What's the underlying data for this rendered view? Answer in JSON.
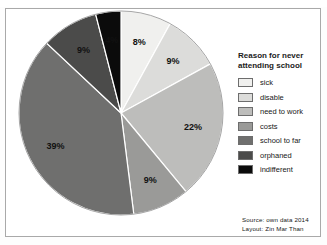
{
  "figure": {
    "top_cropped_text": "",
    "background_color": "#ffffff",
    "border_color": "#a9a9a9"
  },
  "legend": {
    "title_line1": "Reason for never",
    "title_line2": "attending school",
    "items": [
      {
        "label": "sick",
        "color": "#f0f0ee"
      },
      {
        "label": "disable",
        "color": "#dcdcda"
      },
      {
        "label": "need to work",
        "color": "#bdbdbb"
      },
      {
        "label": "costs",
        "color": "#9a9a98"
      },
      {
        "label": "school to far",
        "color": "#6f6f6e"
      },
      {
        "label": "orphaned",
        "color": "#4b4b4a"
      },
      {
        "label": "indifferent",
        "color": "#0b0b0b"
      }
    ]
  },
  "source": {
    "line1": "Source: own data 2014",
    "line2": "Layout: Zin Mar Than"
  },
  "chart_data": {
    "type": "pie",
    "title": "Reason for never attending school",
    "xlabel": "",
    "ylabel": "",
    "units": "percent",
    "start_angle_deg": 0,
    "direction": "clockwise",
    "categories": [
      "sick",
      "disable",
      "need to work",
      "costs",
      "school to far",
      "orphaned",
      "indifferent"
    ],
    "values": [
      8,
      9,
      22,
      9,
      39,
      9,
      4
    ],
    "labels": [
      "8%",
      "9%",
      "22%",
      "9%",
      "39%",
      "9%",
      "4%"
    ],
    "colors": [
      "#f0f0ee",
      "#dcdcda",
      "#bdbdbb",
      "#9a9a98",
      "#6f6f6e",
      "#4b4b4a",
      "#0b0b0b"
    ],
    "label_text_colors": [
      "#161616",
      "#161616",
      "#161616",
      "#161616",
      "#f2f2f2",
      "#f2f2f2",
      "#f2f2f2"
    ],
    "legend_position": "right",
    "grid": false
  },
  "geometry": {
    "center_x": 115,
    "center_y": 104,
    "radius": 102,
    "label_radius_factor": 0.72
  }
}
